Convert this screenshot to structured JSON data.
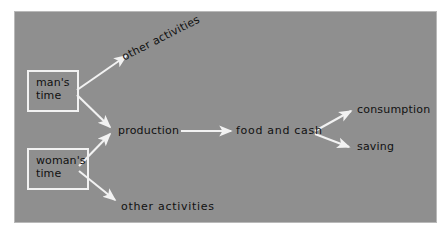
{
  "figure": {
    "kind": "flow-diagram",
    "background_color": "#ffffff",
    "panel_color": "#8f8f8f",
    "stroke_color": "#f2f2f2",
    "text_color": "#111111"
  },
  "nodes": {
    "mans_time": {
      "line1": "man's",
      "line2": "time"
    },
    "womans_time": {
      "line1": "woman's",
      "line2": "time"
    },
    "production": {
      "label": "production"
    },
    "food_and_cash": {
      "label": "food and cash"
    },
    "other_activities_top": {
      "label": "other activities"
    },
    "other_activities_bottom": {
      "label": "other activities"
    },
    "consumption": {
      "label": "consumption"
    },
    "saving": {
      "label": "saving"
    }
  },
  "edges": [
    {
      "name": "mans-time-to-other-activities",
      "from": "man's time",
      "to": "other activities"
    },
    {
      "name": "mans-time-to-production",
      "from": "man's time",
      "to": "production"
    },
    {
      "name": "womans-time-to-production",
      "from": "woman's time",
      "to": "production"
    },
    {
      "name": "womans-time-to-other-activities",
      "from": "woman's time",
      "to": "other activities"
    },
    {
      "name": "production-to-food-and-cash",
      "from": "production",
      "to": "food and cash"
    },
    {
      "name": "food-and-cash-to-consumption",
      "from": "food and cash",
      "to": "consumption"
    },
    {
      "name": "food-and-cash-to-saving",
      "from": "food and cash",
      "to": "saving"
    }
  ]
}
